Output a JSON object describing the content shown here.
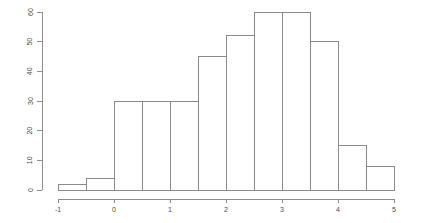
{
  "figure": {
    "background_color": "#ffffff",
    "axis_color": "#8d8d8d",
    "bar_stroke_color": "#8a8a8a",
    "bar_fill_color": "none",
    "label_color": "#4a4a4a"
  },
  "chart_data": {
    "type": "bar",
    "title": "",
    "subtitle": "",
    "xlabel": "",
    "ylabel": "",
    "grid": false,
    "legend": false,
    "legend_position": "none",
    "bin_width": 0.5,
    "xlim": [
      -1,
      5
    ],
    "ylim": [
      0,
      60
    ],
    "x_ticks": [
      -1,
      0,
      1,
      2,
      3,
      4,
      5
    ],
    "x_tick_labels": [
      "-1",
      "0",
      "1",
      "2",
      "3",
      "4",
      "5"
    ],
    "y_ticks": [
      0,
      10,
      20,
      30,
      40,
      50,
      60
    ],
    "y_tick_labels": [
      "0",
      "10",
      "20",
      "30",
      "40",
      "50",
      "60"
    ],
    "bin_edges": [
      -1,
      -0.5,
      0,
      0.5,
      1,
      1.5,
      2,
      2.5,
      3,
      3.5,
      4,
      4.5,
      5
    ],
    "categories": [
      "-1.0 to -0.5",
      "-0.5 to 0.0",
      "0.0 to 0.5",
      "0.5 to 1.0",
      "1.0 to 1.5",
      "1.5 to 2.0",
      "2.0 to 2.5",
      "2.5 to 3.0",
      "3.0 to 3.5",
      "3.5 to 4.0",
      "4.0 to 4.5",
      "4.5 to 5.0"
    ],
    "values": [
      2,
      4,
      30,
      30,
      30,
      45,
      52,
      60,
      60,
      50,
      15,
      8
    ]
  }
}
